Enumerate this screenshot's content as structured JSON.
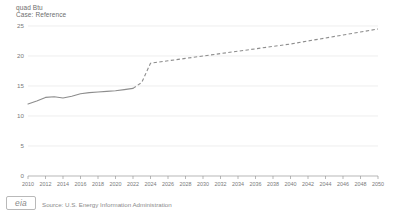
{
  "header": {
    "unit_label": "quad Btu",
    "case_label": "Case: Reference"
  },
  "footer": {
    "logo_text": "eia",
    "source": "Source: U.S. Energy Information Administration"
  },
  "chart_data": {
    "type": "line",
    "title": "",
    "subtitle": "Case: Reference",
    "xlabel": "",
    "ylabel": "quad Btu",
    "ylim": [
      0,
      25
    ],
    "xlim": [
      2010,
      2050
    ],
    "yticks": [
      0,
      5,
      10,
      15,
      20,
      25
    ],
    "ytick_labels": [
      "0",
      "5",
      "10",
      "15",
      "20",
      "25"
    ],
    "xticks": [
      2010,
      2012,
      2014,
      2016,
      2018,
      2020,
      2022,
      2024,
      2026,
      2028,
      2030,
      2032,
      2034,
      2036,
      2038,
      2040,
      2042,
      2044,
      2046,
      2048,
      2050
    ],
    "xtick_labels": [
      "2010",
      "2012",
      "2014",
      "2016",
      "2018",
      "2020",
      "2022",
      "2024",
      "2026",
      "2028",
      "2030",
      "2032",
      "2034",
      "2036",
      "2038",
      "2040",
      "2042",
      "2044",
      "2046",
      "2048",
      "2050"
    ],
    "grid": true,
    "grid_axis": "y",
    "legend": false,
    "legend_position": "none",
    "series": [
      {
        "name": "History",
        "style": "solid",
        "color": "#8d8d8d",
        "x": [
          2010,
          2011,
          2012,
          2013,
          2014,
          2015,
          2016,
          2017,
          2018,
          2019,
          2020,
          2021,
          2022
        ],
        "values": [
          12.0,
          12.5,
          13.1,
          13.2,
          13.0,
          13.3,
          13.7,
          13.9,
          14.0,
          14.1,
          14.2,
          14.4,
          14.6
        ]
      },
      {
        "name": "Projection",
        "style": "dashed",
        "color": "#8d8d8d",
        "x": [
          2022,
          2023,
          2024,
          2026,
          2028,
          2030,
          2032,
          2034,
          2036,
          2038,
          2040,
          2042,
          2044,
          2046,
          2048,
          2050
        ],
        "values": [
          14.6,
          15.6,
          18.8,
          19.2,
          19.6,
          20.0,
          20.4,
          20.8,
          21.2,
          21.6,
          22.0,
          22.5,
          23.0,
          23.5,
          24.0,
          24.5
        ]
      }
    ]
  }
}
